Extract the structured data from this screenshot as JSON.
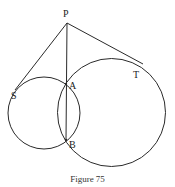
{
  "figure": {
    "caption": "Figure 75",
    "colors": {
      "stroke": "#2a2a2a",
      "background": "#ffffff"
    },
    "points": {
      "P": {
        "label": "P",
        "x": 67,
        "y": 23
      },
      "A": {
        "label": "A",
        "x": 66,
        "y": 84
      },
      "B": {
        "label": "B",
        "x": 66,
        "y": 140
      },
      "S": {
        "label": "S",
        "x": 15,
        "y": 90
      },
      "T": {
        "label": "T",
        "x": 143,
        "y": 64
      }
    },
    "circles": [
      {
        "name": "small-circle",
        "cx": 44,
        "cy": 113,
        "r": 36
      },
      {
        "name": "large-circle",
        "cx": 111.5,
        "cy": 112.5,
        "r": 54
      }
    ],
    "segments": [
      {
        "name": "PS",
        "from": "P",
        "to": "S"
      },
      {
        "name": "PT",
        "from": "P",
        "to": "T"
      },
      {
        "name": "PB",
        "from": "P",
        "to": "B"
      }
    ]
  }
}
